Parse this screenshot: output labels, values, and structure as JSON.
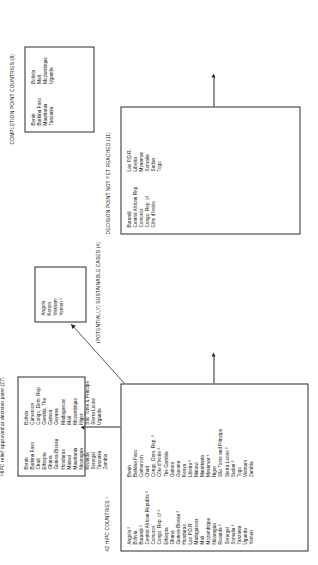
{
  "diagram": {
    "type": "flow-diagram",
    "orientation": "rotated-90-ccw",
    "boxes": {
      "all_hipc": {
        "caption": "42 HIPC COUNTRIES ¹",
        "columns": [
          [
            "Angola ²",
            "Bolivia",
            "Burundi ²",
            "Central African Republic ²",
            "Comoros",
            "Congo, Rep. of ²",
            "Ethiopia",
            "Ghana",
            "Guinea-Bissau ²",
            "Honduras",
            "Lao P.D.R.",
            "Madagascar",
            "Mali",
            "Mozambique",
            "Nicaragua",
            "Rwanda ²",
            "Senegal",
            "Somalia ²",
            "Tanzania",
            "Uganda",
            "Yemen"
          ],
          [
            "Benin",
            "Burkina Faso",
            "Cameroon",
            "Chad",
            "Congo, Dem. Rep. ²",
            "Côte d'Ivoire ²",
            "The Gambia",
            "Guinea",
            "Guyana",
            "Kenya",
            "Liberia ²",
            "Malawi",
            "Mauritania",
            "Myanmar ²",
            "Niger",
            "São Tomé and Principe",
            "Sierra Leone ²",
            "Sudan ²",
            "Togo",
            "Vietnam",
            "Zambia"
          ]
        ]
      },
      "decision_point_approved": {
        "caption": "HIPC relief approved at decision point (27)",
        "columns": [
          [
            "Benin",
            "Burkina Faso",
            "Chad",
            "Ethiopia",
            "Ghana",
            "Guinea-Bissau",
            "Honduras",
            "Malawi",
            "Mauritania",
            "Nicaragua",
            "Rwanda",
            "Senegal",
            "Tanzania",
            "Zambia"
          ],
          [
            "Bolivia",
            "Cameroon",
            "Congo, Dem. Rep.",
            "Gambia, The",
            "Guinea",
            "Guyana",
            "Madagascar",
            "Mali",
            "Mozambique",
            "Niger",
            "São Tomé & Principe",
            "Sierra Leone",
            "Uganda"
          ]
        ]
      },
      "completion_point": {
        "caption": "COMPLETION POINT COUNTRIES (8)",
        "columns": [
          [
            "Benin",
            "Burkina Faso",
            "Mauritania",
            "Tanzania"
          ],
          [
            "Bolivia",
            "Mali",
            "Mozambique",
            "Uganda"
          ]
        ]
      },
      "sustainable_cases": {
        "caption": "(POTENTIALLY) SUSTAINABLE CASES (4)",
        "columns": [
          [
            "Angola",
            "Kenya",
            "Vietnam",
            "Yemen ²"
          ]
        ]
      },
      "not_yet_reached": {
        "caption": "DECISION POINT NOT YET REACHED (11)",
        "columns": [
          [
            "Burundi",
            "Central African Rep.",
            "Comoros",
            "Congo, Rep. of",
            "Côte d'Ivoire"
          ],
          [
            "Lao P.D.R.",
            "Liberia",
            "Myanmar",
            "Somalia",
            "Sudan",
            "Togo"
          ]
        ]
      }
    }
  },
  "colors": {
    "stroke": "#2b2b2b",
    "background": "#ffffff",
    "text": "#111111"
  }
}
